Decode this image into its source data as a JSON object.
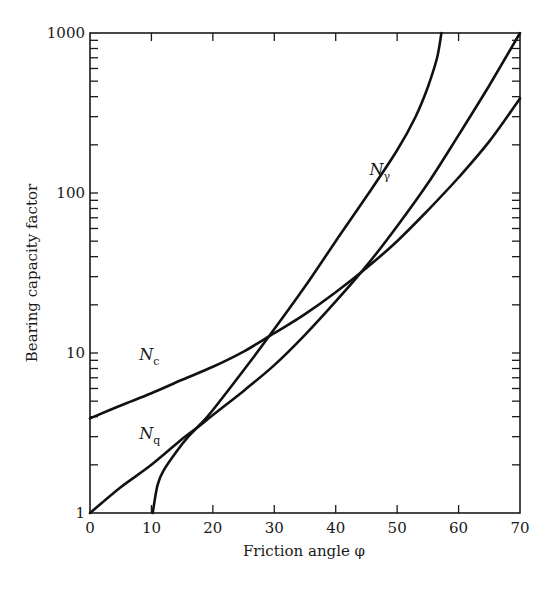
{
  "chart_data": {
    "type": "line",
    "title": "",
    "xlabel": "Friction angle φ",
    "ylabel": "Bearing capacity factor",
    "xlim": [
      0,
      70
    ],
    "ylim": [
      1,
      1000
    ],
    "yscale": "log",
    "grid": false,
    "legend": "none (inline curve labels)",
    "x_ticks": [
      0,
      10,
      20,
      30,
      40,
      50,
      60,
      70
    ],
    "y_ticks": [
      1,
      10,
      100,
      1000
    ],
    "series": [
      {
        "name": "Nc",
        "label_main": "N",
        "label_sub": "c",
        "label_pos": [
          8,
          9.0
        ],
        "x": [
          0,
          5,
          10,
          15,
          20,
          25,
          30,
          35,
          40,
          45,
          50,
          55,
          60,
          65,
          70
        ],
        "values": [
          3.9,
          4.7,
          5.6,
          6.8,
          8.2,
          10.2,
          13.3,
          17.5,
          24,
          34,
          50,
          78,
          125,
          210,
          390
        ]
      },
      {
        "name": "Nq",
        "label_main": "N",
        "label_sub": "q",
        "label_pos": [
          8,
          2.9
        ],
        "x": [
          0,
          5,
          10,
          15,
          17.8,
          20,
          25,
          30,
          35,
          40,
          45,
          50,
          55,
          60,
          65,
          70
        ],
        "values": [
          1,
          1.45,
          2.0,
          2.9,
          3.5,
          4.1,
          5.8,
          8.4,
          13,
          21,
          35,
          62,
          115,
          230,
          470,
          1000
        ]
      },
      {
        "name": "Ngamma",
        "label_main": "N",
        "label_sub": "γ",
        "label_pos": [
          45.5,
          130
        ],
        "x": [
          10.2,
          11,
          12,
          14,
          16,
          18,
          20,
          25,
          29,
          35,
          40,
          45,
          50,
          53,
          55,
          56.5,
          57.2
        ],
        "values": [
          1,
          1.5,
          1.85,
          2.4,
          3.0,
          3.6,
          4.4,
          7.8,
          12.5,
          26,
          50,
          95,
          185,
          300,
          460,
          700,
          1000
        ]
      }
    ]
  }
}
